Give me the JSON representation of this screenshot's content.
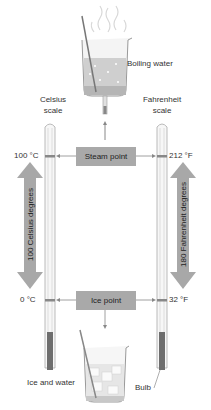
{
  "diagram": {
    "labels": {
      "boiling_water": "Boiling water",
      "celsius_scale": [
        "Celsius",
        "scale"
      ],
      "fahrenheit_scale": [
        "Fahrenheit",
        "scale"
      ],
      "steam_point": "Steam point",
      "ice_point": "Ice point",
      "celsius_high": "100 °C",
      "fahrenheit_high": "212 °F",
      "celsius_low": "0 °C",
      "fahrenheit_low": "32 °F",
      "celsius_span": "100 Celsius degrees",
      "fahrenheit_span": "180 Fahrenheit degrees",
      "ice_and_water": "Ice and water",
      "bulb": "Bulb"
    },
    "colors": {
      "box_fill": "#a9a9a9",
      "arrow_fill": "#a8a8a8",
      "line": "#888888",
      "mercury": "#6e6e6e"
    }
  }
}
